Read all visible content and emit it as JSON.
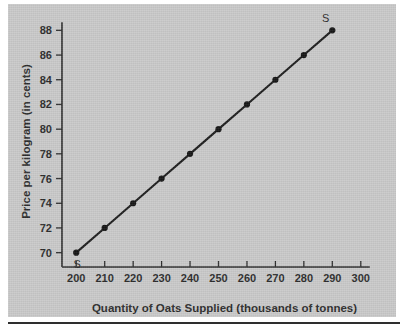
{
  "figure": {
    "background_color": "#c9c9c9",
    "ink_color": "#2b2b2b"
  },
  "chart_data": {
    "type": "line",
    "title": "",
    "subtitle": "",
    "xlabel": "Quantity of Oats Supplied (thousands of tonnes)",
    "ylabel": "Price per kilogram (in cents)",
    "xlim": [
      195,
      305
    ],
    "ylim": [
      69,
      89
    ],
    "xticks": [
      200,
      210,
      220,
      230,
      240,
      250,
      260,
      270,
      280,
      290,
      300
    ],
    "yticks": [
      70,
      72,
      74,
      76,
      78,
      80,
      82,
      84,
      86,
      88
    ],
    "xtick_labels": [
      "200",
      "210",
      "220",
      "230",
      "240",
      "250",
      "260",
      "270",
      "280",
      "290",
      "300"
    ],
    "ytick_labels": [
      "70",
      "72",
      "74",
      "76",
      "78",
      "80",
      "82",
      "84",
      "86",
      "88"
    ],
    "grid": false,
    "legend": "none",
    "series": [
      {
        "name": "S",
        "marker": "filled-circle",
        "x": [
          200,
          210,
          220,
          230,
          240,
          250,
          260,
          270,
          280,
          290
        ],
        "y": [
          70,
          72,
          74,
          76,
          78,
          80,
          82,
          84,
          86,
          88
        ]
      }
    ],
    "annotations": [
      {
        "text": "S",
        "x": 200,
        "y": 70,
        "position": "below-right-of-point"
      },
      {
        "text": "S",
        "x": 290,
        "y": 88,
        "position": "above-left-of-point"
      }
    ]
  }
}
